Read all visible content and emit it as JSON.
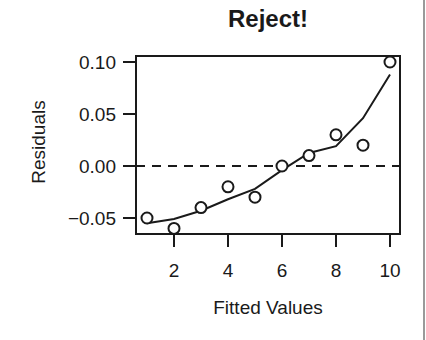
{
  "chart_data": {
    "type": "scatter",
    "title": "Reject!",
    "xlabel": "Fitted Values",
    "ylabel": "Residuals",
    "xlim": [
      0.6,
      10.35
    ],
    "ylim": [
      -0.066,
      0.104
    ],
    "x_ticks": [
      2,
      4,
      6,
      8,
      10
    ],
    "x_tick_labels": [
      "2",
      "4",
      "6",
      "8",
      "10"
    ],
    "y_ticks": [
      -0.05,
      0.0,
      0.05,
      0.1
    ],
    "y_tick_labels": [
      "-0.05",
      "0.00",
      "0.05",
      "0.10"
    ],
    "grid": false,
    "legend": null,
    "reference_line": {
      "y": 0.0,
      "style": "dashed"
    },
    "series": [
      {
        "name": "Residuals",
        "type": "scatter",
        "marker": "open-circle",
        "x": [
          1,
          2,
          3,
          4,
          5,
          6,
          7,
          8,
          9,
          10
        ],
        "y": [
          -0.05,
          -0.06,
          -0.04,
          -0.02,
          -0.03,
          0.0,
          0.01,
          0.03,
          0.02,
          0.1
        ]
      },
      {
        "name": "Smoother",
        "type": "line",
        "x": [
          1,
          2,
          3,
          4,
          5,
          6,
          7,
          8,
          9,
          10
        ],
        "y": [
          -0.055,
          -0.051,
          -0.043,
          -0.032,
          -0.022,
          -0.004,
          0.0125,
          0.019,
          0.046,
          0.088
        ]
      }
    ]
  },
  "colors": {
    "ink": "#1a1a1a",
    "background": "#ffffff",
    "right_rule": "#9a9a9a"
  }
}
